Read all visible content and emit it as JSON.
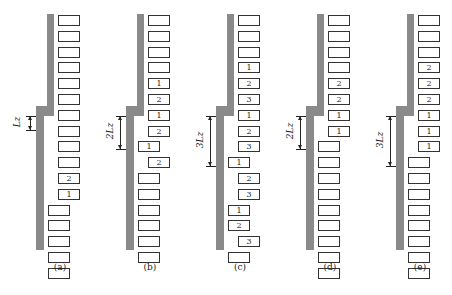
{
  "figure": {
    "panels": [
      {
        "id": "a",
        "caption": "(a)",
        "offset_label": "L_z",
        "offset_label_display": "Lz",
        "bricks_upper": [
          "",
          "",
          "",
          "",
          "",
          "",
          "",
          "",
          "",
          "",
          "2",
          "1"
        ],
        "bricks_lower": [
          "",
          "",
          "",
          "",
          ""
        ]
      },
      {
        "id": "b",
        "caption": "(b)",
        "offset_label": "2L_z",
        "offset_label_display": "2Lz",
        "bricks_upper": [
          "",
          "",
          "",
          "",
          "1",
          "2",
          "1",
          "2"
        ],
        "bricks_mixed": [
          {
            "label": "1",
            "shift": "left"
          },
          {
            "label": "2",
            "shift": "right"
          }
        ],
        "bricks_lower": [
          "",
          "",
          "",
          "",
          "",
          ""
        ]
      },
      {
        "id": "c",
        "caption": "(c)",
        "offset_label": "3L_z",
        "offset_label_display": "3Lz",
        "bricks_upper": [
          "",
          "",
          "",
          "1",
          "2",
          "3",
          "1",
          "2",
          "3"
        ],
        "bricks_mixed": [
          {
            "label": "1",
            "shift": "left"
          },
          {
            "label": "2",
            "shift": "right"
          },
          {
            "label": "3",
            "shift": "right"
          },
          {
            "label": "1",
            "shift": "left"
          },
          {
            "label": "2",
            "shift": "left"
          },
          {
            "label": "3",
            "shift": "right"
          }
        ],
        "bricks_lower": [
          ""
        ]
      },
      {
        "id": "d",
        "caption": "(d)",
        "offset_label": "2L_z",
        "offset_label_display": "2Lz",
        "bricks_upper": [
          "",
          "",
          "",
          "",
          "2",
          "2",
          "1",
          "1"
        ],
        "bricks_lower": [
          "",
          "",
          "",
          "",
          "",
          "",
          "",
          "",
          ""
        ]
      },
      {
        "id": "e",
        "caption": "(e)",
        "offset_label": "3L_z",
        "offset_label_display": "3Lz",
        "bricks_upper": [
          "",
          "",
          "",
          "2",
          "2",
          "2",
          "1",
          "1",
          "1"
        ],
        "bricks_lower": [
          "",
          "",
          "",
          "",
          "",
          "",
          "",
          ""
        ]
      }
    ]
  }
}
